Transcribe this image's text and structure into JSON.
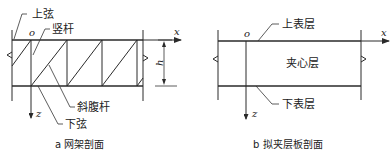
{
  "figure_a": {
    "caption": "a 网架剖面",
    "labels": {
      "top_chord": "上弦",
      "vertical_member": "竖杆",
      "diagonal_member": "斜腹杆",
      "bottom_chord": "下弦"
    },
    "axes": {
      "origin": "o",
      "x": "x",
      "z": "z",
      "height": "h"
    }
  },
  "figure_b": {
    "caption": "b 拟夹层板剖面",
    "labels": {
      "top_skin": "上表层",
      "core": "夹心层",
      "bottom_skin": "下表层"
    },
    "axes": {
      "origin": "o",
      "x": "x",
      "z": "z"
    }
  },
  "colors": {
    "line": "#2a2a2a",
    "background": "#ffffff"
  }
}
